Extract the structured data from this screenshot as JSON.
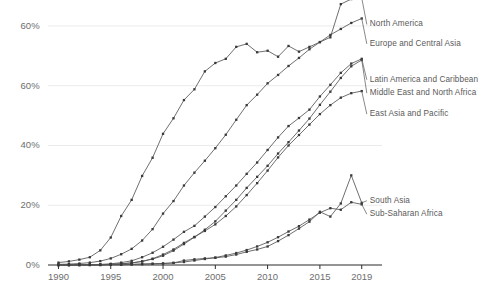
{
  "chart_data": {
    "type": "line",
    "title": "",
    "subtitle": "",
    "xlabel": "",
    "ylabel": "",
    "xlim": [
      1989,
      2019.6
    ],
    "ylim": [
      0,
      84
    ],
    "grid": true,
    "legend_position": "right-inline-labels",
    "y_ticks": [
      {
        "value": 80,
        "label": "60%"
      },
      {
        "value": 60,
        "label": "60%"
      },
      {
        "value": 40,
        "label": "40%"
      },
      {
        "value": 20,
        "label": "20%"
      },
      {
        "value": 0,
        "label": "0%"
      }
    ],
    "x_ticks": [
      {
        "value": 1990,
        "label": "1990"
      },
      {
        "value": 1995,
        "label": "1995"
      },
      {
        "value": 2000,
        "label": "2000"
      },
      {
        "value": 2005,
        "label": "2005"
      },
      {
        "value": 2010,
        "label": "2010"
      },
      {
        "value": 2015,
        "label": "2015"
      },
      {
        "value": 2019,
        "label": "2019"
      }
    ],
    "x": [
      1990,
      1991,
      1992,
      1993,
      1994,
      1995,
      1996,
      1997,
      1998,
      1999,
      2000,
      2001,
      2002,
      2003,
      2004,
      2005,
      2006,
      2007,
      2008,
      2009,
      2010,
      2011,
      2012,
      2013,
      2014,
      2015,
      2016,
      2017,
      2018,
      2019
    ],
    "series": [
      {
        "name": "North America",
        "color": "#555555",
        "label_x": 2019.2,
        "label_y": 80.5,
        "values": [
          0.8,
          1.2,
          1.8,
          2.6,
          4.9,
          9.2,
          16.4,
          21.8,
          29.8,
          35.9,
          43.9,
          49.1,
          55.2,
          58.8,
          64.8,
          67.6,
          69.0,
          73.0,
          74.0,
          71.2,
          71.7,
          69.7,
          73.3,
          71.4,
          73.0,
          74.6,
          76.2,
          87.3,
          89.0,
          89.4
        ],
        "endpoint_value": 89.4
      },
      {
        "name": "Europe and Central Asia",
        "color": "#555555",
        "label_x": 2019.2,
        "label_y": 74.0,
        "values": [
          0.2,
          0.3,
          0.5,
          0.8,
          1.3,
          2.2,
          3.6,
          5.4,
          8.2,
          12.0,
          17.2,
          21.4,
          26.6,
          30.9,
          34.9,
          39.1,
          43.6,
          48.6,
          53.5,
          57.0,
          60.8,
          63.6,
          66.6,
          69.3,
          72.2,
          74.6,
          77.0,
          79.0,
          81.0,
          82.5
        ],
        "endpoint_value": 82.5
      },
      {
        "name": "Latin America and Caribbean",
        "color": "#555555",
        "label_x": 2019.2,
        "label_y": 62.0,
        "values": [
          0.0,
          0.0,
          0.1,
          0.1,
          0.2,
          0.4,
          0.8,
          1.4,
          2.6,
          4.1,
          6.1,
          8.5,
          11.1,
          13.1,
          16.2,
          19.4,
          23.0,
          26.6,
          30.5,
          34.3,
          38.5,
          42.7,
          46.5,
          49.2,
          52.0,
          56.4,
          60.3,
          64.3,
          67.4,
          69.0
        ],
        "endpoint_value": 69.0
      },
      {
        "name": "Middle East and North Africa",
        "color": "#555555",
        "label_x": 2019.2,
        "label_y": 57.5,
        "values": [
          0.0,
          0.0,
          0.0,
          0.1,
          0.1,
          0.2,
          0.4,
          0.7,
          1.2,
          2.0,
          3.1,
          4.8,
          7.0,
          9.3,
          11.8,
          14.6,
          18.2,
          21.8,
          25.8,
          29.5,
          33.2,
          37.3,
          41.1,
          45.0,
          49.0,
          53.6,
          58.0,
          62.6,
          66.5,
          68.6
        ],
        "endpoint_value": 68.6
      },
      {
        "name": "East Asia and Pacific",
        "color": "#555555",
        "label_x": 2019.2,
        "label_y": 50.5,
        "values": [
          0.0,
          0.0,
          0.0,
          0.1,
          0.1,
          0.2,
          0.4,
          0.7,
          1.2,
          2.1,
          3.5,
          5.2,
          7.4,
          9.4,
          11.4,
          13.6,
          16.4,
          19.6,
          23.4,
          27.4,
          31.6,
          36.0,
          40.0,
          43.5,
          47.0,
          50.5,
          53.5,
          56.0,
          57.5,
          58.2
        ],
        "endpoint_value": 58.2
      },
      {
        "name": "South Asia",
        "color": "#555555",
        "label_x": 2019.2,
        "label_y": 21.5,
        "values": [
          0.0,
          0.0,
          0.0,
          0.0,
          0.0,
          0.1,
          0.1,
          0.2,
          0.3,
          0.4,
          0.5,
          0.7,
          1.5,
          1.9,
          2.2,
          2.4,
          2.8,
          3.5,
          4.4,
          5.2,
          6.2,
          8.0,
          10.0,
          12.2,
          14.5,
          17.8,
          16.2,
          20.6,
          30.0,
          20.8
        ],
        "endpoint_value": 20.8
      },
      {
        "name": "Sub-Saharan Africa",
        "color": "#555555",
        "label_x": 2019.2,
        "label_y": 17.0,
        "values": [
          0.0,
          0.0,
          0.0,
          0.0,
          0.0,
          0.1,
          0.1,
          0.2,
          0.3,
          0.4,
          0.5,
          0.7,
          1.0,
          1.5,
          2.0,
          2.5,
          3.2,
          4.0,
          5.0,
          6.2,
          7.6,
          9.3,
          11.2,
          13.0,
          15.2,
          17.5,
          19.0,
          18.5,
          21.0,
          20.3
        ],
        "endpoint_value": 20.3
      }
    ],
    "annotations": [
      {
        "text": "North America",
        "x": 2019.2,
        "y": 80.5
      },
      {
        "text": "Europe and Central Asia",
        "x": 2019.2,
        "y": 74.0
      },
      {
        "text": "Latin America and Caribbean",
        "x": 2019.2,
        "y": 62.0
      },
      {
        "text": "Middle East and North Africa",
        "x": 2019.2,
        "y": 57.5
      },
      {
        "text": "East Asia and Pacific",
        "x": 2019.2,
        "y": 50.5
      },
      {
        "text": "South Asia",
        "x": 2019.2,
        "y": 21.5
      },
      {
        "text": "Sub-Saharan Africa",
        "x": 2019.2,
        "y": 17.0
      }
    ],
    "style": {
      "line_color": "#555555",
      "marker_color": "#3a3a3a",
      "grid_color": "#ebebeb",
      "axis_color": "#2b2b2b",
      "tick_text_color": "#6e6e6e",
      "label_text_color": "#5a5a5a",
      "background": "#ffffff"
    }
  },
  "labels": {
    "y": [
      "60%",
      "60%",
      "40%",
      "20%",
      "0%"
    ],
    "x": [
      "1990",
      "1995",
      "2000",
      "2005",
      "2010",
      "2015",
      "2019"
    ],
    "series": [
      "North America",
      "Europe and Central Asia",
      "Latin America and Caribbean",
      "Middle East and North Africa",
      "East Asia and Pacific",
      "South Asia",
      "Sub-Saharan Africa"
    ]
  }
}
